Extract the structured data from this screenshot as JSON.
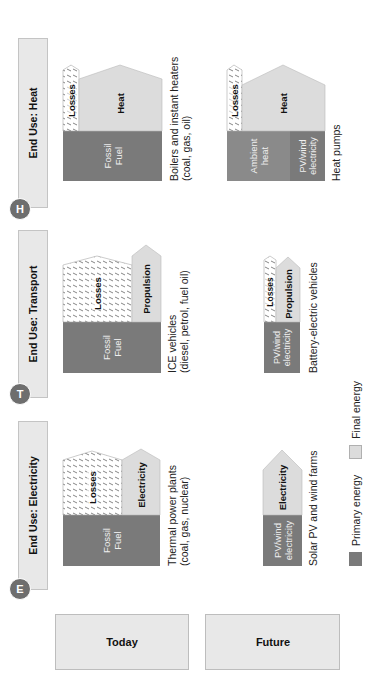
{
  "colors": {
    "primary": "#7a7a7a",
    "final": "#dcdcdc",
    "header_bg": "#e8e8e8",
    "badge": "#6e6e6e"
  },
  "rows": {
    "today": "Today",
    "future": "Future"
  },
  "columns": [
    {
      "badge": "E",
      "title": "End Use: Electricity"
    },
    {
      "badge": "T",
      "title": "End Use: Transport"
    },
    {
      "badge": "H",
      "title": "End Use: Heat"
    }
  ],
  "cells": {
    "electricity_today": {
      "primary_label": "Fossil\nFuel",
      "losses_label": "Losses",
      "final_label": "Electricity",
      "caption_line1": "Thermal power plants",
      "caption_line2": "(coal, gas, nuclear)"
    },
    "electricity_future": {
      "primary_label": "PV/wind\nelectricity",
      "final_label": "Electricity",
      "caption_line1": "Solar PV and wind farms"
    },
    "transport_today": {
      "primary_label": "Fossil\nFuel",
      "losses_label": "Losses",
      "final_label": "Propulsion",
      "caption_line1": "ICE vehicles",
      "caption_line2": "(diesel, petrol, fuel oil)"
    },
    "transport_future": {
      "primary_label": "PV/wind\nelectricity",
      "losses_label": "Losses",
      "final_label": "Propulsion",
      "caption_line1": "Battery-electric vehicles"
    },
    "heat_today": {
      "primary_label": "Fossil\nFuel",
      "losses_label": "Losses",
      "final_label": "Heat",
      "caption_line1": "Boilers and instant heaters",
      "caption_line2": "(coal, gas, oil)"
    },
    "heat_future": {
      "primary_label_1": "Ambient\nheat",
      "primary_label_2": "PV/wind\nelectricity",
      "losses_label": "Losses",
      "final_label": "Heat",
      "caption_line1": "Heat pumps"
    }
  },
  "legend": [
    {
      "label": "Primary energy",
      "color": "#7a7a7a"
    },
    {
      "label": "Final energy",
      "color": "#dcdcdc"
    }
  ]
}
